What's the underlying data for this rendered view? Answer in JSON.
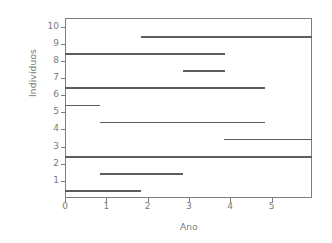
{
  "chart_data": {
    "type": "line",
    "title": "",
    "xlabel": "Ano",
    "ylabel": "Indivíduos",
    "xlim": [
      0,
      5.98
    ],
    "ylim": [
      0,
      10.5
    ],
    "xticks": [
      0,
      1,
      2,
      3,
      4,
      5
    ],
    "xticklabels": [
      "0",
      "1",
      "2",
      "3",
      "4",
      "5"
    ],
    "yticks": [
      1,
      2,
      3,
      4,
      5,
      6,
      7,
      8,
      9,
      10
    ],
    "yticklabels": [
      "1",
      "2",
      "3",
      "4",
      "5",
      "6",
      "7",
      "8",
      "9",
      "10"
    ],
    "grid": false,
    "legend": null,
    "series": [
      {
        "name": "10",
        "individual": 10,
        "y": 9.45,
        "x_start": 1.85,
        "x_end": 5.98
      },
      {
        "name": "9",
        "individual": 9,
        "y": 8.45,
        "x_start": 0.0,
        "x_end": 3.88
      },
      {
        "name": "8",
        "individual": 8,
        "y": 7.45,
        "x_start": 2.85,
        "x_end": 3.88
      },
      {
        "name": "7",
        "individual": 7,
        "y": 6.45,
        "x_start": 0.0,
        "x_end": 4.85
      },
      {
        "name": "6",
        "individual": 6,
        "y": 5.45,
        "x_start": 0.0,
        "x_end": 0.85
      },
      {
        "name": "5",
        "individual": 5,
        "y": 4.45,
        "x_start": 0.85,
        "x_end": 4.85
      },
      {
        "name": "4",
        "individual": 4,
        "y": 3.45,
        "x_start": 3.85,
        "x_end": 5.98
      },
      {
        "name": "3",
        "individual": 3,
        "y": 2.45,
        "x_start": 0.0,
        "x_end": 5.98
      },
      {
        "name": "2",
        "individual": 2,
        "y": 1.45,
        "x_start": 0.85,
        "x_end": 2.85
      },
      {
        "name": "1",
        "individual": 1,
        "y": 0.45,
        "x_start": 0.0,
        "x_end": 1.85
      }
    ],
    "colors": {
      "line": "#5d5d5d",
      "axis": "#7d7d7d",
      "text": "#7a7a7a",
      "background": "#ffffff"
    }
  }
}
